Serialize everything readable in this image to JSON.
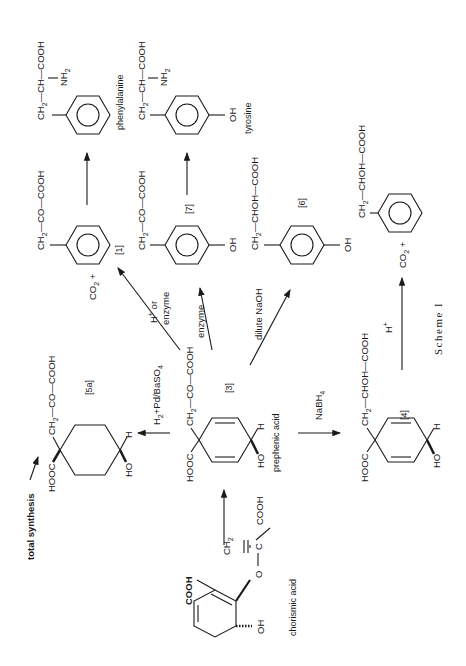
{
  "scheme": {
    "title": "Scheme I",
    "orientation": "rotated 90 degrees counter-clockwise"
  },
  "compounds": {
    "chorismic_acid": {
      "name": "chorismic acid",
      "substituents": [
        "COOH",
        "OH",
        "O",
        "C",
        "CH2",
        "COOH"
      ]
    },
    "prephenic_acid": {
      "name": "prephenic acid",
      "label": "[3]",
      "side_chain": "CH2—CO—COOH",
      "substituents": [
        "HOOC",
        "HO",
        "H"
      ]
    },
    "compound_5a": {
      "label": "[5a]",
      "side_chain": "CH2—CO—COOH",
      "substituents": [
        "HOOC",
        "HO",
        "H"
      ]
    },
    "compound_4": {
      "label": "[4]",
      "side_chain": "CH2—CHOH—COOH",
      "substituents": [
        "HOOC",
        "HO",
        "H"
      ]
    },
    "compound_1": {
      "label": "[1]",
      "side_chain": "CH2—CO—COOH",
      "coproduct": "CO2 +"
    },
    "compound_7": {
      "label": "[7]",
      "side_chain": "CH2—CO—COOH",
      "substituent": "OH"
    },
    "compound_6": {
      "label": "[6]",
      "side_chain": "CH2—CHOH—COOH",
      "substituent": "OH"
    },
    "phenylalanine": {
      "name": "phenylalanine",
      "side_chain": "CH2—CH—COOH",
      "amine": "NH2"
    },
    "tyrosine": {
      "name": "tyrosine",
      "side_chain": "CH2—CH—COOH",
      "amine": "NH2",
      "substituent": "OH"
    },
    "phenyllactic": {
      "side_chain": "CH2—CHOH—COOH",
      "coproduct": "CO2 +"
    }
  },
  "reagents": {
    "hydrogenation": "H2+Pd/BaSO4",
    "acid_or_enzyme_1": "H+ or",
    "acid_or_enzyme_2": "enzyme",
    "enzyme": "enzyme",
    "dilute_naoh": "dilute NaOH",
    "nabh4": "NaBH4",
    "acid": "H+"
  },
  "annotations": {
    "total_synthesis": "total synthesis"
  }
}
